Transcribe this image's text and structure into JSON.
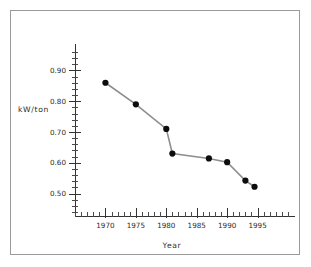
{
  "figure": {
    "background_color": "#ffffff",
    "border_color": "#9a9a9a"
  },
  "chart_data": {
    "type": "line",
    "title": "",
    "subtitle": "",
    "xlabel": "Year",
    "ylabel": "kW/ton",
    "xlim": [
      1965,
      2000
    ],
    "ylim": [
      0.44,
      0.96
    ],
    "xticks": [
      1970,
      1975,
      1980,
      1985,
      1990,
      1995
    ],
    "xtick_labels": [
      "1970",
      "1975",
      "1980",
      "1985",
      "1990",
      "1995"
    ],
    "x_minor_tick_interval": 1,
    "yticks": [
      0.5,
      0.6,
      0.7,
      0.8,
      0.9
    ],
    "ytick_labels": [
      "0.50",
      "0.60",
      "0.70",
      "0.80",
      "0.90"
    ],
    "y_minor_tick_interval": 0.02,
    "grid": false,
    "legend": false,
    "legend_position": "none",
    "marker": "circle",
    "marker_color": "#0d0d0d",
    "line_color": "#8e8e8e",
    "series": [
      {
        "name": "kW/ton",
        "x": [
          1970,
          1975,
          1980,
          1981,
          1987,
          1990,
          1993,
          1994.5
        ],
        "values": [
          0.86,
          0.79,
          0.71,
          0.63,
          0.614,
          0.602,
          0.542,
          0.522
        ]
      }
    ]
  },
  "axis": {
    "y_label_text": "kW/ton",
    "x_label_text": "Year"
  }
}
